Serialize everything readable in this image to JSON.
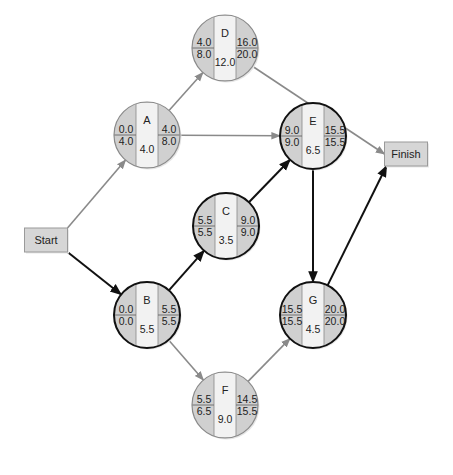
{
  "diagram": {
    "type": "activity-on-node network (CPM)",
    "start": {
      "label": "Start",
      "x": 46,
      "y": 240
    },
    "finish": {
      "label": "Finish",
      "x": 406,
      "y": 154
    },
    "colors": {
      "node_fill": "#d0d0d0",
      "node_center_fill": "#f2f2f2",
      "box_fill": "#d6d6d6",
      "critical_stroke": "#111111",
      "noncritical_stroke": "#8a8a8a"
    },
    "nodes": [
      {
        "id": "A",
        "x": 147,
        "y": 135,
        "critical": false,
        "es": "0.0",
        "lf_left": "4.0",
        "ef": "4.0",
        "lf": "8.0",
        "duration": "4.0"
      },
      {
        "id": "B",
        "x": 147,
        "y": 315,
        "critical": true,
        "es": "0.0",
        "lf_left": "0.0",
        "ef": "5.5",
        "lf": "5.5",
        "duration": "5.5"
      },
      {
        "id": "C",
        "x": 226,
        "y": 226,
        "critical": true,
        "es": "5.5",
        "lf_left": "5.5",
        "ef": "9.0",
        "lf": "9.0",
        "duration": "3.5"
      },
      {
        "id": "D",
        "x": 225,
        "y": 48,
        "critical": false,
        "es": "4.0",
        "lf_left": "8.0",
        "ef": "16.0",
        "lf": "20.0",
        "duration": "12.0"
      },
      {
        "id": "E",
        "x": 313,
        "y": 136,
        "critical": true,
        "es": "9.0",
        "lf_left": "9.0",
        "ef": "15.5",
        "lf": "15.5",
        "duration": "6.5"
      },
      {
        "id": "F",
        "x": 225,
        "y": 405,
        "critical": false,
        "es": "5.5",
        "lf_left": "6.5",
        "ef": "14.5",
        "lf": "15.5",
        "duration": "9.0"
      },
      {
        "id": "G",
        "x": 313,
        "y": 315,
        "critical": true,
        "es": "15.5",
        "lf_left": "15.5",
        "ef": "20.0",
        "lf": "20.0",
        "duration": "4.5"
      }
    ],
    "edges": [
      {
        "from": "Start",
        "to": "A",
        "critical": false
      },
      {
        "from": "Start",
        "to": "B",
        "critical": true
      },
      {
        "from": "A",
        "to": "D",
        "critical": false
      },
      {
        "from": "A",
        "to": "E",
        "critical": false
      },
      {
        "from": "B",
        "to": "C",
        "critical": true
      },
      {
        "from": "B",
        "to": "F",
        "critical": false
      },
      {
        "from": "C",
        "to": "E",
        "critical": true
      },
      {
        "from": "D",
        "to": "Finish",
        "critical": false
      },
      {
        "from": "E",
        "to": "G",
        "critical": true
      },
      {
        "from": "F",
        "to": "G",
        "critical": false
      },
      {
        "from": "G",
        "to": "Finish",
        "critical": true
      }
    ]
  }
}
